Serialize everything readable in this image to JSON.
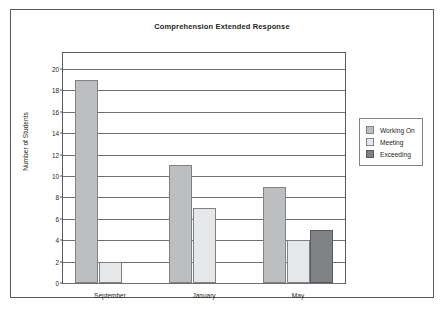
{
  "chart_data": {
    "type": "bar",
    "title": "Comprehension Extended Response",
    "xlabel": "",
    "ylabel": "Number of Students",
    "categories": [
      "September",
      "January",
      "May"
    ],
    "series": [
      {
        "name": "Working On",
        "color": "#bcbec0",
        "values": [
          19,
          11,
          9
        ]
      },
      {
        "name": "Meeting",
        "color": "#e6e7e8",
        "values": [
          2,
          7,
          4
        ]
      },
      {
        "name": "Exceeding",
        "color": "#808285",
        "values": [
          0,
          0,
          5
        ]
      }
    ],
    "ylim": [
      0,
      21.5
    ],
    "yticks": [
      0,
      2,
      4,
      6,
      8,
      10,
      12,
      14,
      16,
      18,
      20
    ],
    "grid": "horizontal",
    "legend_position": "right"
  }
}
